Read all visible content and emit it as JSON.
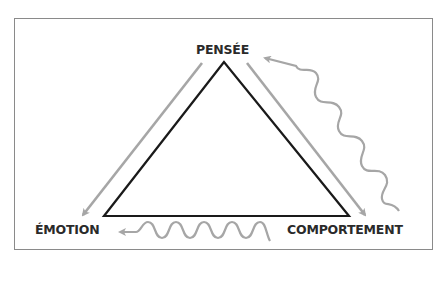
{
  "diagram": {
    "type": "cognitive-triangle",
    "nodes": [
      {
        "id": "pensee",
        "label": "PENSÉE"
      },
      {
        "id": "emotion",
        "label": "ÉMOTION"
      },
      {
        "id": "comportement",
        "label": "COMPORTEMENT"
      }
    ],
    "edges": [
      {
        "from": "pensee",
        "to": "emotion",
        "style": "straight-arrow"
      },
      {
        "from": "pensee",
        "to": "comportement",
        "style": "straight-arrow"
      },
      {
        "from": "comportement",
        "to": "pensee",
        "style": "wavy-arrow"
      },
      {
        "from": "comportement",
        "to": "emotion",
        "style": "wavy-arrow"
      }
    ],
    "colors": {
      "triangle": "#1a1a1a",
      "arrows": "#a6a6a6",
      "frame": "#8a8a8a",
      "text": "#2a2a2a"
    }
  }
}
